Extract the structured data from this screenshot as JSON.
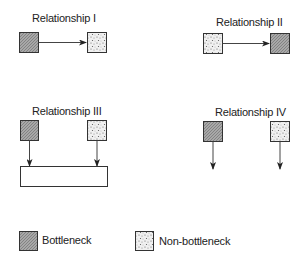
{
  "diagram": {
    "relationships": [
      {
        "label": "Relationship I",
        "type": "bottleneck-feeds-non-bottleneck"
      },
      {
        "label": "Relationship II",
        "type": "non-bottleneck-feeds-bottleneck"
      },
      {
        "label": "Relationship III",
        "type": "both-feed-assembly"
      },
      {
        "label": "Relationship IV",
        "type": "independent-outputs"
      }
    ],
    "legend": {
      "bottleneck_label": "Bottleneck",
      "non_bottleneck_label": "Non-bottleneck"
    },
    "colors": {
      "bottleneck_fill": "#9a9a9a",
      "non_bottleneck_fill": "#e6e6e6",
      "stroke": "#333333"
    }
  }
}
